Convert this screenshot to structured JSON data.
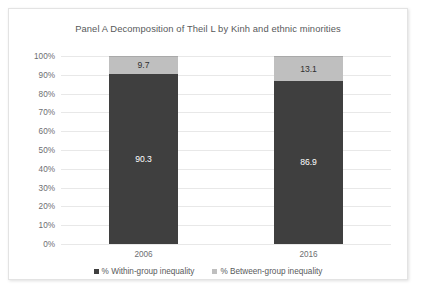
{
  "chart_data": {
    "type": "bar",
    "subtype": "stacked-100-percent",
    "title": "Panel A Decomposition of Theil L by Kinh and ethnic minorities",
    "xlabel": "",
    "ylabel": "",
    "categories": [
      "2006",
      "2016"
    ],
    "series": [
      {
        "name": "% Within-group inequality",
        "legend_label": "% Within-group inequality",
        "color": "#3f3f3f",
        "values": [
          90.3,
          86.9
        ],
        "labels": [
          "90.3",
          "86.9"
        ]
      },
      {
        "name": "% Between-group inequality",
        "legend_label": "% Between-group inequality",
        "color": "#bfbfbf",
        "values": [
          9.7,
          13.1
        ],
        "labels": [
          "9.7",
          "13.1"
        ]
      }
    ],
    "ylim": [
      0,
      100
    ],
    "ytick_labels": [
      "100%",
      "90%",
      "80%",
      "70%",
      "60%",
      "50%",
      "40%",
      "30%",
      "20%",
      "10%",
      "0%"
    ],
    "ytick_values": [
      100,
      90,
      80,
      70,
      60,
      50,
      40,
      30,
      20,
      10,
      0
    ],
    "grid": true,
    "grid_axis": "y",
    "legend_position": "bottom"
  }
}
